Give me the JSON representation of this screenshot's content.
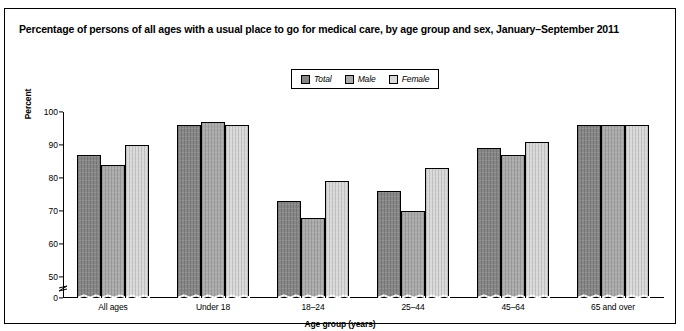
{
  "title": "Percentage of persons of all ages with a usual place to go for medical care, by age group and sex, January–September 2011",
  "legend": {
    "items": [
      {
        "label": "Total",
        "color": "#878787"
      },
      {
        "label": "Male",
        "color": "#ababab"
      },
      {
        "label": "Female",
        "color": "#d9d9d9"
      }
    ]
  },
  "chart_data": {
    "type": "bar",
    "title": "Percentage of persons of all ages with a usual place to go for medical care, by age group and sex, January–September 2011",
    "xlabel": "Age group (years)",
    "ylabel": "Percent",
    "categories": [
      "All ages",
      "Under 18",
      "18–24",
      "25–44",
      "45–64",
      "65 and over"
    ],
    "series": [
      {
        "name": "Total",
        "color": "#878787",
        "values": [
          87,
          96,
          73,
          76,
          89,
          96
        ]
      },
      {
        "name": "Male",
        "color": "#ababab",
        "values": [
          84,
          97,
          68,
          70,
          87,
          96
        ]
      },
      {
        "name": "Female",
        "color": "#d9d9d9",
        "values": [
          90,
          96,
          79,
          83,
          91,
          96
        ]
      }
    ],
    "ylim": [
      0,
      100
    ],
    "yticks": [
      0,
      50,
      60,
      70,
      80,
      90,
      100
    ],
    "ytick_labels": [
      "0",
      "50",
      "60",
      "70",
      "80",
      "90",
      "100"
    ],
    "axis_break": {
      "present": true,
      "between": [
        0,
        50
      ],
      "style": "zigzag"
    },
    "grid": false,
    "legend_position": "top-center"
  }
}
